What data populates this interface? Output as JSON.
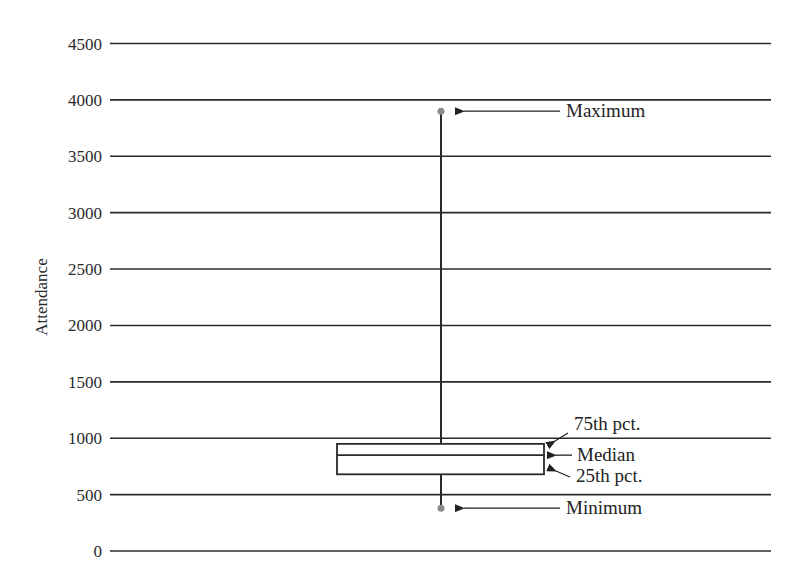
{
  "chart_data": {
    "type": "box",
    "title": "",
    "xlabel": "",
    "ylabel": "Attendance",
    "ylim": [
      0,
      4500
    ],
    "yticks": [
      0,
      500,
      1000,
      1500,
      2000,
      2500,
      3000,
      3500,
      4000,
      4500
    ],
    "ytick_labels": [
      "0",
      "500",
      "1000",
      "1500",
      "2000",
      "2500",
      "3000",
      "3500",
      "4000",
      "4500"
    ],
    "grid": true,
    "legend": "none",
    "box": {
      "minimum": 380,
      "q1": 680,
      "median": 850,
      "q3": 950,
      "maximum": 3900
    },
    "annotations": [
      {
        "label": "Maximum",
        "points_to": "maximum"
      },
      {
        "label": "75th pct.",
        "points_to": "q3"
      },
      {
        "label": "Median",
        "points_to": "median"
      },
      {
        "label": "25th pct.",
        "points_to": "q1"
      },
      {
        "label": "Minimum",
        "points_to": "minimum"
      }
    ]
  },
  "style": {
    "line_color": "#2a2a2a",
    "dot_color": "#8a8a8a",
    "background": "#ffffff"
  }
}
